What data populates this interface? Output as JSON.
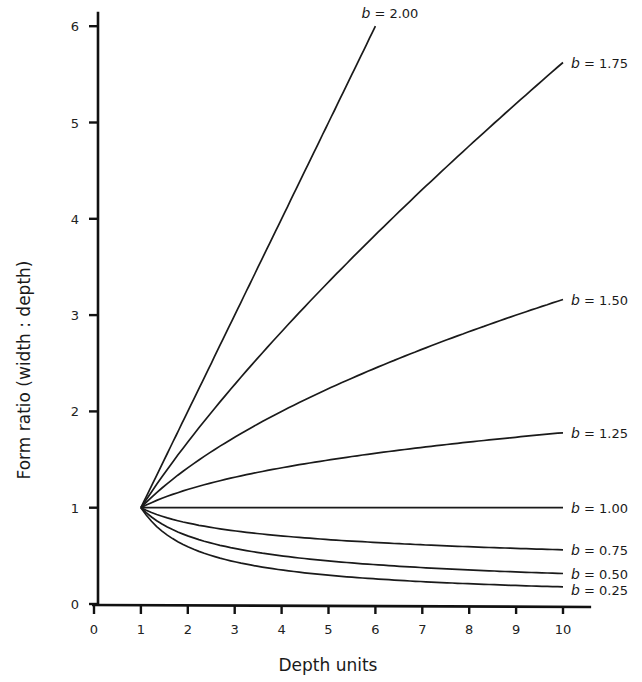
{
  "chart_data": {
    "type": "line",
    "title": "",
    "xlabel": "Depth units",
    "ylabel": "Form ratio (width : depth)",
    "xlim": [
      0,
      10.6
    ],
    "ylim": [
      0,
      6.15
    ],
    "x_ticks": [
      "0",
      "1",
      "2",
      "3",
      "4",
      "5",
      "6",
      "7",
      "8",
      "9",
      "10"
    ],
    "y_ticks": [
      "0",
      "1",
      "2",
      "3",
      "4",
      "5",
      "6"
    ],
    "grid": false,
    "legend": "inline labels at right end of each curve",
    "formula": "form ratio = depth^(b - 1)",
    "series": [
      {
        "name": "b = 2.00",
        "b_var": "b",
        "b_text": " = 2.00",
        "b": 2.0,
        "x": [
          1,
          2,
          3,
          4,
          5,
          6
        ],
        "values": [
          1,
          2,
          3,
          4,
          5,
          6
        ]
      },
      {
        "name": "b = 1.75",
        "b_var": "b",
        "b_text": " = 1.75",
        "b": 1.75,
        "x": [
          1,
          2,
          3,
          4,
          5,
          6,
          7,
          8,
          9,
          10
        ],
        "values": [
          1,
          1.68,
          2.28,
          2.83,
          3.34,
          3.83,
          4.3,
          4.76,
          5.2,
          5.62
        ]
      },
      {
        "name": "b = 1.50",
        "b_var": "b",
        "b_text": " = 1.50",
        "b": 1.5,
        "x": [
          1,
          2,
          3,
          4,
          5,
          6,
          7,
          8,
          9,
          10
        ],
        "values": [
          1,
          1.41,
          1.73,
          2.0,
          2.24,
          2.45,
          2.65,
          2.83,
          3.0,
          3.16
        ]
      },
      {
        "name": "b = 1.25",
        "b_var": "b",
        "b_text": " = 1.25",
        "b": 1.25,
        "x": [
          1,
          2,
          3,
          4,
          5,
          6,
          7,
          8,
          9,
          10
        ],
        "values": [
          1,
          1.19,
          1.32,
          1.41,
          1.5,
          1.57,
          1.63,
          1.68,
          1.73,
          1.78
        ]
      },
      {
        "name": "b = 1.00",
        "b_var": "b",
        "b_text": " = 1.00",
        "b": 1.0,
        "x": [
          1,
          2,
          3,
          4,
          5,
          6,
          7,
          8,
          9,
          10
        ],
        "values": [
          1,
          1,
          1,
          1,
          1,
          1,
          1,
          1,
          1,
          1
        ]
      },
      {
        "name": "b = 0.75",
        "b_var": "b",
        "b_text": " = 0.75",
        "b": 0.75,
        "x": [
          1,
          2,
          3,
          4,
          5,
          6,
          7,
          8,
          9,
          10
        ],
        "values": [
          1,
          0.84,
          0.76,
          0.71,
          0.67,
          0.64,
          0.61,
          0.59,
          0.58,
          0.56
        ]
      },
      {
        "name": "b = 0.50",
        "b_var": "b",
        "b_text": " = 0.50",
        "b": 0.5,
        "x": [
          1,
          2,
          3,
          4,
          5,
          6,
          7,
          8,
          9,
          10
        ],
        "values": [
          1,
          0.71,
          0.58,
          0.5,
          0.45,
          0.41,
          0.38,
          0.35,
          0.33,
          0.32
        ]
      },
      {
        "name": "b = 0.25",
        "b_var": "b",
        "b_text": " = 0.25",
        "b": 0.25,
        "x": [
          1,
          2,
          3,
          4,
          5,
          6,
          7,
          8,
          9,
          10
        ],
        "values": [
          1,
          0.59,
          0.44,
          0.35,
          0.3,
          0.26,
          0.23,
          0.21,
          0.19,
          0.18
        ]
      }
    ]
  }
}
